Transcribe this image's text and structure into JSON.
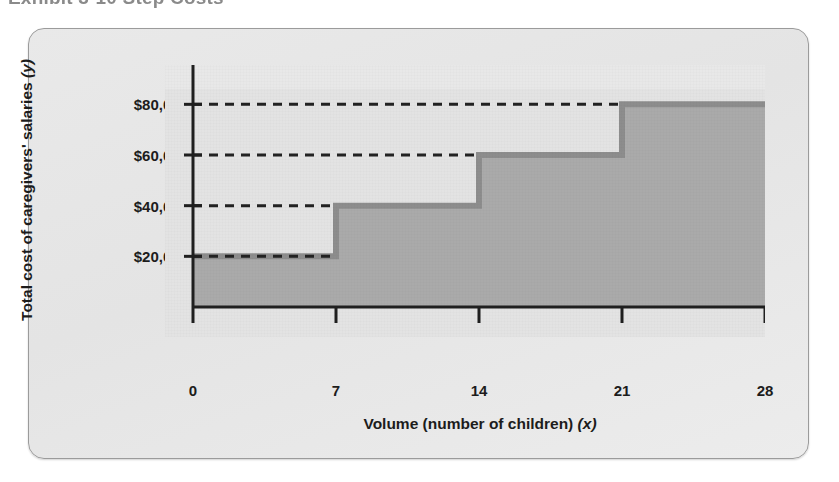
{
  "figure": {
    "title_partial": "Exhibit 3-10  Step Costs",
    "card_label": "step-cost-figure-card"
  },
  "chart_data": {
    "type": "area",
    "subtype": "step",
    "title": "Exhibit 3-10  Step Costs",
    "xlabel": "Volume (number of children) (x)",
    "ylabel": "Total cost of caregivers' salaries (y)",
    "xlabel_main": "Volume (number of children)",
    "xlabel_var": "(x)",
    "ylabel_main": "Total cost of caregivers' salaries",
    "ylabel_var": "(y)",
    "x_ticks": [
      0,
      7,
      14,
      21,
      28
    ],
    "x_tick_labels": [
      "0",
      "7",
      "14",
      "21",
      "28"
    ],
    "y_ticks": [
      20000,
      40000,
      60000,
      80000
    ],
    "y_tick_labels": [
      "$20,000",
      "$40,000",
      "$60,000",
      "$80,000"
    ],
    "xlim": [
      0,
      28
    ],
    "ylim": [
      0,
      90000
    ],
    "grid": false,
    "legend": null,
    "steps": [
      {
        "x_start": 0,
        "x_end": 7,
        "y": 20000,
        "label": "$20,000"
      },
      {
        "x_start": 7,
        "x_end": 14,
        "y": 40000,
        "label": "$40,000"
      },
      {
        "x_start": 14,
        "x_end": 21,
        "y": 60000,
        "label": "$60,000"
      },
      {
        "x_start": 21,
        "x_end": 28,
        "y": 80000,
        "label": "$80,000"
      }
    ],
    "dashed_reference_lines": [
      {
        "y": 20000,
        "from_x": 0,
        "to_x": 7
      },
      {
        "y": 40000,
        "from_x": 0,
        "to_x": 7
      },
      {
        "y": 60000,
        "from_x": 0,
        "to_x": 14
      },
      {
        "y": 80000,
        "from_x": 0,
        "to_x": 21
      }
    ],
    "colors": {
      "plot_background": "#e3e3e3",
      "area_fill": "#aaaaaa",
      "step_line": "#8d8d8d",
      "axis": "#1f1f1f",
      "dash": "#222222",
      "card_background": "#e7e7e7",
      "card_border": "#9b9b9b",
      "text": "#1c1c1c"
    }
  }
}
